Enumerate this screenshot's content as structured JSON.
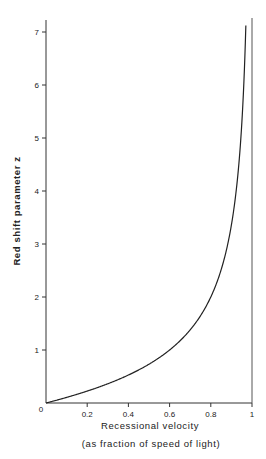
{
  "chart_data": {
    "type": "line",
    "title": "",
    "xlabel": "Recessional velocity",
    "xlabel_sub": "(as fraction of speed of light)",
    "ylabel": "Red shift parameter z",
    "xlim": [
      0,
      1
    ],
    "ylim": [
      0,
      7.2
    ],
    "x_ticks": [
      0.2,
      0.4,
      0.6,
      0.8,
      1
    ],
    "x_tick_labels": [
      "0.2",
      "0.4",
      "0.6",
      "0.8",
      "1"
    ],
    "y_ticks": [
      1,
      2,
      3,
      4,
      5,
      6,
      7
    ],
    "y_tick_labels": [
      "1",
      "2",
      "3",
      "4",
      "5",
      "6",
      "7"
    ],
    "origin_label": "0",
    "grid": false,
    "legend": null,
    "annotations": [
      "vertical asymptote at v = 1"
    ],
    "series": [
      {
        "name": "z = sqrt((1+v)/(1-v)) - 1",
        "x": [
          0,
          0.1,
          0.2,
          0.3,
          0.4,
          0.5,
          0.6,
          0.7,
          0.8,
          0.85,
          0.9,
          0.92,
          0.94,
          0.95,
          0.96,
          0.97
        ],
        "values": [
          0,
          0.106,
          0.225,
          0.363,
          0.528,
          0.732,
          1.0,
          1.38,
          2.0,
          2.512,
          3.359,
          3.899,
          4.686,
          5.245,
          6.0,
          7.2
        ]
      }
    ]
  }
}
